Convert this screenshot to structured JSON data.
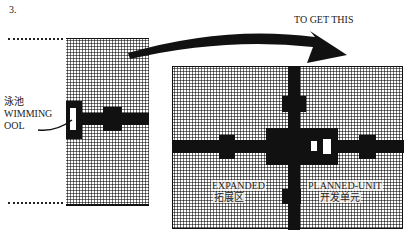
{
  "figure": {
    "number": "3.",
    "caption": "TO GET THIS"
  },
  "left_plan": {
    "label_cn": "泳池",
    "label_en_line1": "WIMMING",
    "label_en_line2": "OOL"
  },
  "right_plan": {
    "left_label_en": "EXPANDED",
    "left_label_cn": "拓展区",
    "right_label_en": "PLANNED-UNIT",
    "right_label_cn": "开发单元"
  },
  "colors": {
    "ink": "#111111",
    "paper": "#ffffff"
  }
}
